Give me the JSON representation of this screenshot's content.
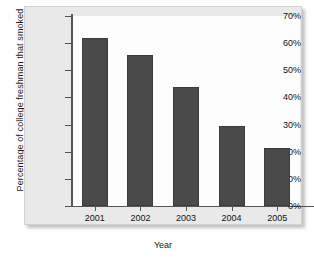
{
  "chart_data": {
    "type": "bar",
    "title": "",
    "xlabel": "Year",
    "ylabel": "Percentage of college freshman that smoked",
    "categories": [
      "2001",
      "2002",
      "2003",
      "2004",
      "2005"
    ],
    "values": [
      62,
      55.5,
      44,
      29.5,
      21.5
    ],
    "ylim": [
      0,
      70
    ],
    "ytick_labels": [
      "0%",
      "10%",
      "20%",
      "30%",
      "40%",
      "50%",
      "60%",
      "70%"
    ],
    "ytick_values": [
      0,
      10,
      20,
      30,
      40,
      50,
      60,
      70
    ],
    "grid": false,
    "legend": "none",
    "bar_color": "#4a4a4a",
    "panel_color": "#e9e9e9",
    "plot_color": "#fdfdfd",
    "axis_color": "#555555"
  }
}
